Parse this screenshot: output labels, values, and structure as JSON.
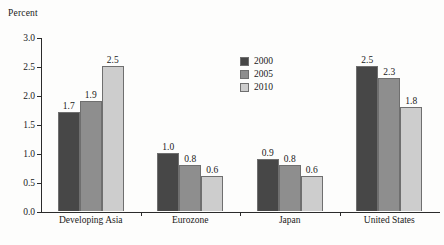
{
  "chart_data": {
    "type": "bar",
    "title": "",
    "xlabel": "",
    "ylabel": "Percent",
    "ylim": [
      0,
      3.0
    ],
    "ytick_step": 0.5,
    "yticks": [
      "0.0",
      "0.5",
      "1.0",
      "1.5",
      "2.0",
      "2.5",
      "3.0"
    ],
    "grid": false,
    "legend_position": "center",
    "categories": [
      "Developing Asia",
      "Eurozone",
      "Japan",
      "United States"
    ],
    "series": [
      {
        "name": "2000",
        "color": "#474747",
        "values": [
          1.7,
          1.0,
          0.9,
          2.5
        ],
        "labels": [
          "1.7",
          "1.0",
          "0.9",
          "2.5"
        ]
      },
      {
        "name": "2005",
        "color": "#8e8e8e",
        "values": [
          1.9,
          0.8,
          0.8,
          2.3
        ],
        "labels": [
          "1.9",
          "0.8",
          "0.8",
          "2.3"
        ]
      },
      {
        "name": "2010",
        "color": "#cdcdcd",
        "values": [
          2.5,
          0.6,
          0.6,
          1.8
        ],
        "labels": [
          "2.5",
          "0.6",
          "0.6",
          "1.8"
        ]
      }
    ]
  },
  "axis": {
    "y_title": "Percent"
  },
  "colors": {
    "series_2000": "#474747",
    "series_2005": "#8e8e8e",
    "series_2010": "#cdcdcd",
    "axis": "#2b2b2b",
    "text": "#1a1a1a",
    "background": "#fdfdfc"
  }
}
